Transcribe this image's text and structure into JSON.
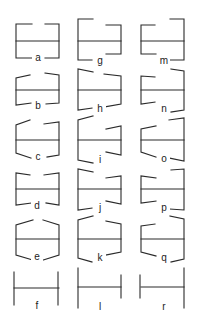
{
  "diagram": {
    "layout": {
      "columns": 3,
      "rows": 6
    },
    "figures": [
      {
        "label": "a",
        "col": 0,
        "row": 0,
        "type": "bracket-both-open-top-gap",
        "description": "horizontal line with square bracket ends above and below, gaps top center and bottom center"
      },
      {
        "label": "b",
        "col": 0,
        "row": 1,
        "type": "slanted-outward",
        "description": "wings slant slightly outward at top, bracket bottom"
      },
      {
        "label": "c",
        "col": 0,
        "row": 2,
        "type": "slanted-outward-both",
        "description": "wings slant outward top and bottom"
      },
      {
        "label": "d",
        "col": 0,
        "row": 3,
        "type": "slanted-inward",
        "description": "wings slant inward toward center top and bottom"
      },
      {
        "label": "e",
        "col": 0,
        "row": 4,
        "type": "slanted-inward-strong",
        "description": "wings slant inward more steeply"
      },
      {
        "label": "f",
        "col": 0,
        "row": 5,
        "type": "plain-verticals",
        "description": "horizontal line with vertical end bars only"
      },
      {
        "label": "g",
        "col": 1,
        "row": 0,
        "type": "offset-bracket",
        "description": "left bracket tall, right bracket shorter, offset"
      },
      {
        "label": "h",
        "col": 1,
        "row": 1,
        "type": "offset-slanted",
        "description": "left bracket taller with slanted wings, right shorter"
      },
      {
        "label": "i",
        "col": 1,
        "row": 2,
        "type": "offset-slanted-outward",
        "description": "left tall with outward slanting wings, right short"
      },
      {
        "label": "j",
        "col": 1,
        "row": 3,
        "type": "offset-slanted-inward",
        "description": "left tall, right short, wings slant"
      },
      {
        "label": "k",
        "col": 1,
        "row": 4,
        "type": "offset-slanted-inward-strong",
        "description": "left tall, right short, wings slant inward"
      },
      {
        "label": "l",
        "col": 1,
        "row": 5,
        "type": "offset-verticals",
        "description": "left vertical bar taller than right"
      },
      {
        "label": "m",
        "col": 2,
        "row": 0,
        "type": "offset-bracket-reverse",
        "description": "right bracket tall, left bracket shorter"
      },
      {
        "label": "n",
        "col": 2,
        "row": 1,
        "type": "offset-slanted-reverse",
        "description": "right tall, left short, slanted wings"
      },
      {
        "label": "o",
        "col": 2,
        "row": 2,
        "type": "offset-slanted-outward-reverse",
        "description": "right tall, left short, wings slant outward"
      },
      {
        "label": "p",
        "col": 2,
        "row": 3,
        "type": "offset-slanted-inward-reverse",
        "description": "right tall, left short, wings slant"
      },
      {
        "label": "q",
        "col": 2,
        "row": 4,
        "type": "offset-slanted-inward-strong-reverse",
        "description": "right tall, left short, wings slant inward"
      },
      {
        "label": "r",
        "col": 2,
        "row": 5,
        "type": "offset-verticals-reverse",
        "description": "right vertical bar taller than left"
      }
    ]
  },
  "labels": {
    "a": "a",
    "b": "b",
    "c": "c",
    "d": "d",
    "e": "e",
    "f": "f",
    "g": "g",
    "h": "h",
    "i": "i",
    "j": "j",
    "k": "k",
    "l": "l",
    "m": "m",
    "n": "n",
    "o": "o",
    "p": "p",
    "q": "q",
    "r": "r"
  },
  "colors": {
    "line": "#2a2a2a",
    "background": "#ffffff"
  }
}
